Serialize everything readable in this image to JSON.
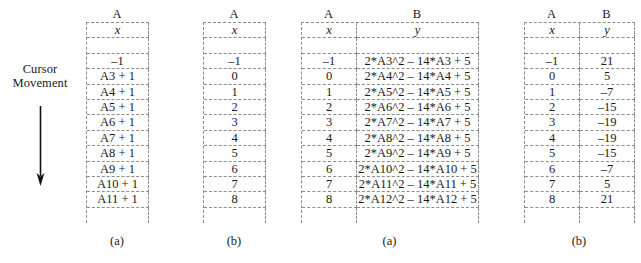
{
  "annotation": {
    "line1": "Cursor",
    "line2": "Movement",
    "arrow_icon": "down-arrow-icon"
  },
  "tables": [
    {
      "id": "sheet-1",
      "caption": "(a)",
      "column_headers": [
        "A"
      ],
      "column_widths": [
        62
      ],
      "header_row": [
        "x"
      ],
      "rows": [
        [
          ""
        ],
        [
          "–1"
        ],
        [
          "A3 + 1"
        ],
        [
          "A4 + 1"
        ],
        [
          "A5 + 1"
        ],
        [
          "A6 + 1"
        ],
        [
          "A7 + 1"
        ],
        [
          "A8 + 1"
        ],
        [
          "A9 + 1"
        ],
        [
          "A10 + 1"
        ],
        [
          "A11 + 1"
        ],
        [
          ""
        ]
      ]
    },
    {
      "id": "sheet-2",
      "caption": "(b)",
      "column_headers": [
        "A"
      ],
      "column_widths": [
        62
      ],
      "header_row": [
        "x"
      ],
      "rows": [
        [
          ""
        ],
        [
          "–1"
        ],
        [
          "0"
        ],
        [
          "1"
        ],
        [
          "2"
        ],
        [
          "3"
        ],
        [
          "4"
        ],
        [
          "5"
        ],
        [
          "6"
        ],
        [
          "7"
        ],
        [
          "8"
        ],
        [
          ""
        ]
      ]
    },
    {
      "id": "sheet-3",
      "caption": "(a)",
      "column_headers": [
        "A",
        "B"
      ],
      "column_widths": [
        55,
        122
      ],
      "header_row": [
        "x",
        "y"
      ],
      "rows": [
        [
          "",
          ""
        ],
        [
          "–1",
          "2*A3^2 – 14*A3 + 5"
        ],
        [
          "0",
          "2*A4^2 – 14*A4 + 5"
        ],
        [
          "1",
          "2*A5^2 – 14*A5 + 5"
        ],
        [
          "2",
          "2*A6^2 – 14*A6 + 5"
        ],
        [
          "3",
          "2*A7^2 – 14*A7 + 5"
        ],
        [
          "4",
          "2*A8^2 – 14*A8 + 5"
        ],
        [
          "5",
          "2*A9^2 – 14*A9 + 5"
        ],
        [
          "6",
          "2*A10^2 – 14*A10 + 5"
        ],
        [
          "7",
          "2*A11^2 – 14*A11 + 5"
        ],
        [
          "8",
          "2*A12^2 – 14*A12 + 5"
        ],
        [
          "",
          ""
        ]
      ]
    },
    {
      "id": "sheet-4",
      "caption": "(b)",
      "column_headers": [
        "A",
        "B"
      ],
      "column_widths": [
        55,
        55
      ],
      "header_row": [
        "x",
        "y"
      ],
      "rows": [
        [
          "",
          ""
        ],
        [
          "–1",
          "21"
        ],
        [
          "0",
          "5"
        ],
        [
          "1",
          "–7"
        ],
        [
          "2",
          "–15"
        ],
        [
          "3",
          "–19"
        ],
        [
          "4",
          "–19"
        ],
        [
          "5",
          "–15"
        ],
        [
          "6",
          "–7"
        ],
        [
          "7",
          "5"
        ],
        [
          "8",
          "21"
        ],
        [
          "",
          ""
        ]
      ]
    }
  ],
  "chart_data": {
    "type": "table",
    "xlabel": "x",
    "ylabel": "y",
    "x": [
      -1,
      0,
      1,
      2,
      3,
      4,
      5,
      6,
      7,
      8
    ],
    "y": [
      21,
      5,
      -7,
      -15,
      -19,
      -19,
      -15,
      -7,
      5,
      21
    ],
    "formula": "2*x^2 - 14*x + 5"
  },
  "colors": {
    "grid_line": "#8d8d8d",
    "text": "#1a1a1a",
    "background": "#ffffff"
  }
}
